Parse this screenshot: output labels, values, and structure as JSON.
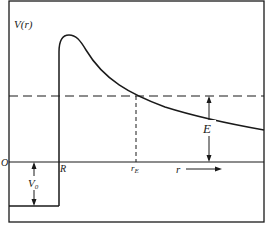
{
  "diagram": {
    "labels": {
      "y_axis": "V(r)",
      "origin": "O",
      "radius": "R",
      "turning_point": "r",
      "turning_point_sub": "E",
      "x_axis": "r",
      "energy": "E",
      "well_depth": "V",
      "well_depth_sub": "0"
    },
    "colors": {
      "line": "#1a1a1a",
      "background": "#ffffff"
    }
  }
}
